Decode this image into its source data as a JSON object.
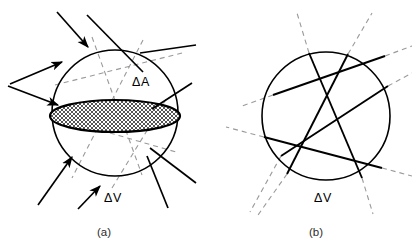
{
  "figure": {
    "kind": "scientific-line-diagram",
    "background_color": "#ffffff",
    "stroke_color": "#000000",
    "dashed_stroke_color": "#9a9a9a",
    "hatch_color": "#555555"
  },
  "panels": [
    {
      "id": "a",
      "caption": "(a)",
      "caption_pos": {
        "x": 104,
        "y": 236
      },
      "circle": {
        "cx": 115,
        "cy": 113,
        "r": 63
      },
      "labels": [
        {
          "name": "delta-a-label",
          "text": "ΔA",
          "x": 132,
          "y": 86
        },
        {
          "name": "delta-v-label",
          "text": "ΔV",
          "x": 104,
          "y": 202
        }
      ],
      "cross_section": {
        "name": "delta-a-ellipse",
        "cx": 115,
        "cy": 116,
        "rx": 65,
        "ry": 16,
        "hatched": true,
        "hatch_color": "#555555",
        "outline_color": "#000000"
      },
      "rays": [
        {
          "name": "ray-1",
          "x1": 57,
          "y1": 12,
          "x2": 88,
          "y2": 47,
          "arrow": true,
          "arrow_at": "end"
        },
        {
          "name": "ray-2",
          "x1": 87,
          "y1": 15,
          "x2": 143,
          "y2": 72,
          "arrow": false
        },
        {
          "name": "ray-3",
          "x1": 140,
          "y1": 53,
          "x2": 196,
          "y2": 45,
          "arrow": false
        },
        {
          "name": "ray-4",
          "x1": 10,
          "y1": 84,
          "x2": 62,
          "y2": 62,
          "arrow": true,
          "arrow_at": "end"
        },
        {
          "name": "ray-5",
          "x1": 8,
          "y1": 86,
          "x2": 58,
          "y2": 105,
          "arrow": true,
          "arrow_at": "end"
        },
        {
          "name": "ray-6",
          "x1": 152,
          "y1": 109,
          "x2": 192,
          "y2": 83,
          "arrow": false
        },
        {
          "name": "ray-7",
          "x1": 38,
          "y1": 205,
          "x2": 72,
          "y2": 157,
          "arrow": true,
          "arrow_at": "end"
        },
        {
          "name": "ray-8",
          "x1": 78,
          "y1": 209,
          "x2": 100,
          "y2": 186,
          "arrow": true,
          "arrow_at": "end"
        },
        {
          "name": "ray-9",
          "x1": 168,
          "y1": 208,
          "x2": 147,
          "y2": 156,
          "arrow": false
        },
        {
          "name": "ray-10",
          "x1": 196,
          "y1": 183,
          "x2": 150,
          "y2": 148,
          "arrow": false
        }
      ],
      "hidden_rays": [
        {
          "name": "hidden-ray-1",
          "x1": 55,
          "y1": 85,
          "x2": 186,
          "y2": 52
        },
        {
          "name": "hidden-ray-2",
          "x1": 92,
          "y1": 37,
          "x2": 142,
          "y2": 175
        },
        {
          "name": "hidden-ray-3",
          "x1": 143,
          "y1": 40,
          "x2": 72,
          "y2": 178
        },
        {
          "name": "hidden-ray-4",
          "x1": 58,
          "y1": 118,
          "x2": 176,
          "y2": 152
        },
        {
          "name": "hidden-ray-5",
          "x1": 112,
          "y1": 188,
          "x2": 168,
          "y2": 96
        }
      ]
    },
    {
      "id": "b",
      "caption": "(b)",
      "caption_pos": {
        "x": 316,
        "y": 236
      },
      "circle": {
        "cx": 326,
        "cy": 116,
        "r": 64
      },
      "labels": [
        {
          "name": "delta-v-label",
          "text": "ΔV",
          "x": 314,
          "y": 202
        }
      ],
      "chords": [
        {
          "name": "chord-1",
          "x1": 273,
          "y1": 95,
          "x2": 385,
          "y2": 56
        },
        {
          "name": "chord-2",
          "x1": 264,
          "y1": 137,
          "x2": 382,
          "y2": 168
        },
        {
          "name": "chord-3",
          "x1": 309,
          "y1": 53,
          "x2": 362,
          "y2": 178
        },
        {
          "name": "chord-4",
          "x1": 348,
          "y1": 54,
          "x2": 287,
          "y2": 174
        },
        {
          "name": "chord-5",
          "x1": 281,
          "y1": 156,
          "x2": 388,
          "y2": 86
        }
      ],
      "extensions": [
        {
          "name": "ext-1",
          "x1": 385,
          "y1": 56,
          "x2": 412,
          "y2": 46
        },
        {
          "name": "ext-2",
          "x1": 273,
          "y1": 95,
          "x2": 242,
          "y2": 106
        },
        {
          "name": "ext-3",
          "x1": 264,
          "y1": 137,
          "x2": 226,
          "y2": 127
        },
        {
          "name": "ext-4",
          "x1": 382,
          "y1": 168,
          "x2": 412,
          "y2": 176
        },
        {
          "name": "ext-5",
          "x1": 309,
          "y1": 53,
          "x2": 297,
          "y2": 13
        },
        {
          "name": "ext-6",
          "x1": 362,
          "y1": 178,
          "x2": 373,
          "y2": 214
        },
        {
          "name": "ext-7",
          "x1": 348,
          "y1": 54,
          "x2": 372,
          "y2": 13
        },
        {
          "name": "ext-8",
          "x1": 287,
          "y1": 174,
          "x2": 258,
          "y2": 215
        },
        {
          "name": "ext-9",
          "x1": 281,
          "y1": 156,
          "x2": 250,
          "y2": 212
        },
        {
          "name": "ext-10",
          "x1": 388,
          "y1": 86,
          "x2": 412,
          "y2": 73
        }
      ]
    }
  ]
}
